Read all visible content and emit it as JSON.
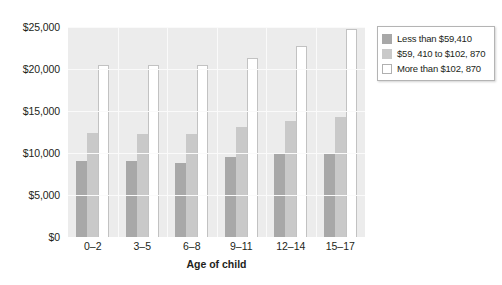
{
  "chart_data": {
    "type": "bar",
    "title": "",
    "subtitle": "",
    "xlabel": "Age of child",
    "ylabel": "",
    "categories": [
      "0–2",
      "3–5",
      "6–8",
      "9–11",
      "12–14",
      "15–17"
    ],
    "series": [
      {
        "name": "Less than $59,410",
        "color": "#a8a8a8",
        "values": [
          9000,
          9000,
          8800,
          9500,
          9900,
          9900
        ]
      },
      {
        "name": "$59, 410 to $102, 870",
        "color": "#c9c9c9",
        "values": [
          12400,
          12300,
          12300,
          13100,
          13800,
          14300
        ]
      },
      {
        "name": "More than $102, 870",
        "color": "#ffffff",
        "values": [
          20500,
          20500,
          20500,
          21300,
          22700,
          24800
        ]
      }
    ],
    "ylim": [
      0,
      25000
    ],
    "y_ticks": [
      0,
      5000,
      10000,
      15000,
      20000,
      25000
    ],
    "y_tick_labels": [
      "$0",
      "$5,000",
      "$10,000",
      "$15,000",
      "$20,000",
      "$25,000"
    ],
    "grid": true,
    "legend_position": "right"
  },
  "legend": {
    "items": [
      {
        "label": "Less than $59,410"
      },
      {
        "label": "$59, 410 to $102, 870"
      },
      {
        "label": "More than $102, 870"
      }
    ]
  }
}
